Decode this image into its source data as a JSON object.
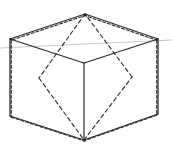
{
  "diagram": {
    "title": "",
    "colors": {
      "background": "#ffffff",
      "edge": "#2b2b2b",
      "dashed": "#2b2b2b",
      "guide": "#c8c8c8"
    },
    "vertices": {
      "top": [
        85,
        14
      ],
      "left_top": [
        10,
        39
      ],
      "right_top": [
        158,
        39
      ],
      "center": [
        84,
        63
      ],
      "left_bottom": [
        10,
        116
      ],
      "right_bottom": [
        158,
        114
      ],
      "bottom": [
        84,
        140
      ],
      "rhombus_left": [
        39,
        78
      ],
      "rhombus_right": [
        132,
        77
      ]
    },
    "guide_line": {
      "from": [
        0,
        48
      ],
      "to": [
        172,
        40
      ]
    },
    "outer_edges": [
      [
        "top",
        "left_top"
      ],
      [
        "top",
        "right_top"
      ],
      [
        "left_top",
        "left_bottom"
      ],
      [
        "right_top",
        "right_bottom"
      ],
      [
        "left_bottom",
        "bottom"
      ],
      [
        "right_bottom",
        "bottom"
      ]
    ],
    "inner_solid_edges": [
      [
        "left_top",
        "center"
      ],
      [
        "right_top",
        "center"
      ],
      [
        "center",
        "bottom"
      ]
    ],
    "dashed_edges": [
      [
        "top",
        "rhombus_left"
      ],
      [
        "rhombus_left",
        "bottom"
      ],
      [
        "bottom",
        "rhombus_right"
      ],
      [
        "rhombus_right",
        "top"
      ]
    ]
  }
}
